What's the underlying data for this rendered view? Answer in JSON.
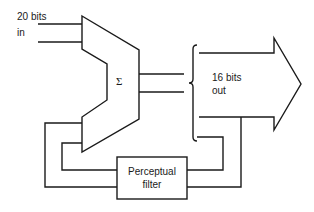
{
  "diagram": {
    "type": "block-diagram",
    "input_label_line1": "20 bits",
    "input_label_line2": "in",
    "summer_symbol": "Σ",
    "output_label_line1": "16 bits",
    "output_label_line2": "out",
    "filter_label_line1": "Perceptual",
    "filter_label_line2": "filter",
    "colors": {
      "stroke": "#1a1a1a",
      "background": "#ffffff"
    }
  }
}
